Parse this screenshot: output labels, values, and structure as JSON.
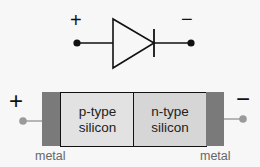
{
  "symbol": {
    "anode_sign": "+",
    "cathode_sign": "−"
  },
  "device": {
    "anode_sign": "+",
    "cathode_sign": "−",
    "p_region": "p-type\nsilicon",
    "p_line1": "p-type",
    "p_line2": "silicon",
    "n_line1": "n-type",
    "n_line2": "silicon",
    "left_contact_label": "metal",
    "right_contact_label": "metal"
  },
  "colors": {
    "background": "#f7f7f7",
    "metal": "#7a7a7a",
    "p_region": "#e2e2e2",
    "n_region": "#d6d6d6",
    "wire": "#9a9a9a",
    "symbol": "#111111"
  }
}
